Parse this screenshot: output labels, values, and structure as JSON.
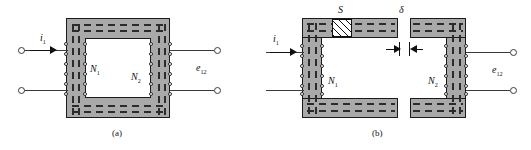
{
  "figure": {
    "type": "technical-diagram",
    "panels": [
      {
        "id": "a",
        "caption": "(a)",
        "description": "closed rectangular laminated core, no air gap",
        "labels": {
          "current": "i",
          "current_sub": "1",
          "primary_winding": "N",
          "primary_winding_sub": "1",
          "secondary_winding": "N",
          "secondary_winding_sub": "2",
          "emf": "e",
          "emf_sub": "12"
        }
      },
      {
        "id": "b",
        "caption": "(b)",
        "description": "split laminated core with air gap and inserted block",
        "labels": {
          "current": "i",
          "current_sub": "1",
          "primary_winding": "N",
          "primary_winding_sub": "1",
          "secondary_winding": "N",
          "secondary_winding_sub": "2",
          "emf": "e",
          "emf_sub": "12",
          "block": "S",
          "gap": "δ"
        }
      }
    ]
  },
  "colors": {
    "core_fill": "#a9a9a9",
    "core_outline": "#1a1a1a",
    "lamination": "#2b2b2b",
    "window_fill": "#ffffff",
    "lead": "#3a3a3a",
    "background": "#ffffff",
    "text": "#111111"
  }
}
